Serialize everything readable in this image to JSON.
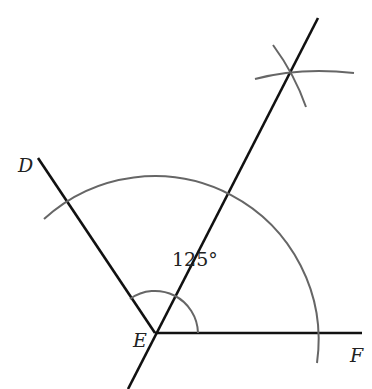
{
  "diagram": {
    "type": "angle-bisector-construction",
    "labels": {
      "D": "D",
      "E": "E",
      "F": "F",
      "angle": "125°"
    },
    "colors": {
      "line": "#111111",
      "arc": "#666666",
      "text": "#222222"
    }
  }
}
